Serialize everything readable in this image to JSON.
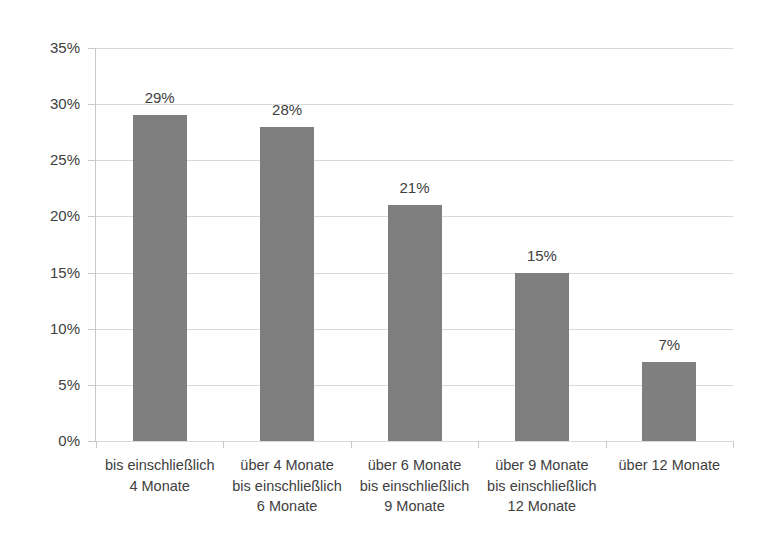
{
  "chart_data": {
    "type": "bar",
    "title": "",
    "subtitle": "",
    "xlabel": "",
    "ylabel": "",
    "categories": [
      "bis einschließlich 4 Monate",
      "über 4 Monate bis einschließlich 6 Monate",
      "über 6 Monate bis einschließlich 9 Monate",
      "über 9 Monate bis einschließlich 12 Monate",
      "über 12 Monate"
    ],
    "category_lines": [
      [
        "bis einschließlich",
        "4 Monate"
      ],
      [
        "über 4 Monate",
        "bis einschließlich",
        "6 Monate"
      ],
      [
        "über 6 Monate",
        "bis einschließlich",
        "9 Monate"
      ],
      [
        "über 9 Monate",
        "bis einschließlich",
        "12 Monate"
      ],
      [
        "über 12 Monate"
      ]
    ],
    "values": [
      29,
      28,
      21,
      15,
      7
    ],
    "data_labels": [
      "29%",
      "28%",
      "21%",
      "15%",
      "7%"
    ],
    "ylim": [
      0,
      35
    ],
    "ytick_values": [
      0,
      5,
      10,
      15,
      20,
      25,
      30,
      35
    ],
    "ytick_labels": [
      "0%",
      "5%",
      "10%",
      "15%",
      "20%",
      "25%",
      "30%",
      "35%"
    ],
    "grid": true,
    "legend": false,
    "legend_position": "none",
    "bar_color": "#7f7f7f",
    "gridline_color": "#d9d9d9",
    "text_color": "#404040",
    "background_color": "#ffffff"
  }
}
